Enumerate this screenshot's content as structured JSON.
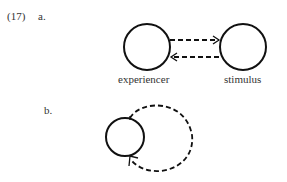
{
  "example": {
    "number": "(17)",
    "part_a": "a.",
    "part_b": "b."
  },
  "diagram_a": {
    "left_node": "experiencer",
    "right_node": "stimulus",
    "arrows": [
      {
        "from": "experiencer",
        "to": "stimulus",
        "style": "dashed"
      },
      {
        "from": "stimulus",
        "to": "experiencer",
        "style": "dashed"
      }
    ]
  },
  "diagram_b": {
    "node": "",
    "loop": {
      "style": "dashed",
      "direction": "self-loop"
    }
  }
}
